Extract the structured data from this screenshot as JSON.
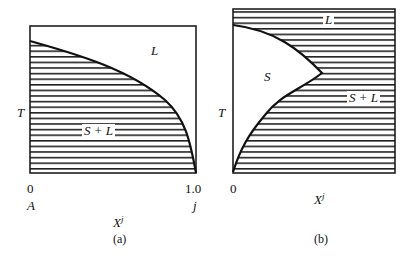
{
  "figure": {
    "panel_a": {
      "caption": "(a)",
      "y_axis_label": "T",
      "x_axis_label": "X",
      "x_axis_superscript": "j",
      "x_tick_left": "0",
      "x_tick_right": "1.0",
      "x_end_left": "A",
      "x_end_right": "j",
      "region_upper": "L",
      "region_lower": "S + L"
    },
    "panel_b": {
      "caption": "(b)",
      "y_axis_label": "T",
      "x_axis_label": "X",
      "x_axis_superscript": "j",
      "x_tick_left": "0",
      "region_top": "L",
      "region_inner": "S",
      "region_right": "S + L"
    }
  },
  "colors": {
    "ink": "#111111",
    "background": "#ffffff"
  }
}
